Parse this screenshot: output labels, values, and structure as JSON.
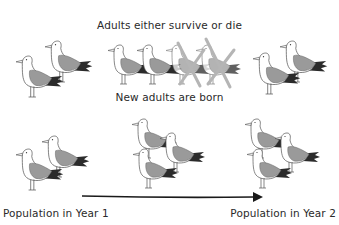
{
  "captions": {
    "top": "Adults either survive or die",
    "middle": "New adults are born"
  },
  "labels": {
    "year1": "Population in Year 1",
    "year2": "Population in Year 2"
  },
  "colors": {
    "outline": "#555555",
    "wing": "#9a9a9a",
    "tail": "#2b2b2b",
    "cross": "#b5b5b5",
    "arrow": "#1a1a1a"
  },
  "groups": [
    {
      "name": "year1-top",
      "birds": 2,
      "dead": 0
    },
    {
      "name": "survivors-and-deaths",
      "birds": 4,
      "dead": 2
    },
    {
      "name": "survivors-right",
      "birds": 2,
      "dead": 0
    },
    {
      "name": "year1-bottom",
      "birds": 2,
      "dead": 0
    },
    {
      "name": "new-adults-middle",
      "birds": 3,
      "dead": 0
    },
    {
      "name": "year2-bottom",
      "birds": 3,
      "dead": 0
    }
  ],
  "arrow": {
    "direction": "right"
  }
}
